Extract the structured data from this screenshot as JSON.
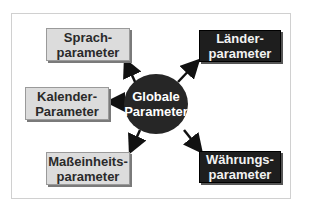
{
  "center": {
    "line1": "Globale",
    "line2": "Parameter"
  },
  "nodes": [
    {
      "id": "sprach",
      "line1": "Sprach-",
      "line2": "parameter",
      "style": "light"
    },
    {
      "id": "kalender",
      "line1": "Kalender-",
      "line2": "Parameter",
      "style": "light"
    },
    {
      "id": "masseinheits",
      "line1": "Maßeinheits-",
      "line2": "parameter",
      "style": "light"
    },
    {
      "id": "laender",
      "line1": "Länder-",
      "line2": "parameter",
      "style": "dark"
    },
    {
      "id": "waehrungs",
      "line1": "Währungs-",
      "line2": "parameter",
      "style": "dark"
    }
  ],
  "colors": {
    "light_box": "#dcdcdc",
    "dark_box": "#1e1e1e",
    "circle": "#262626"
  }
}
